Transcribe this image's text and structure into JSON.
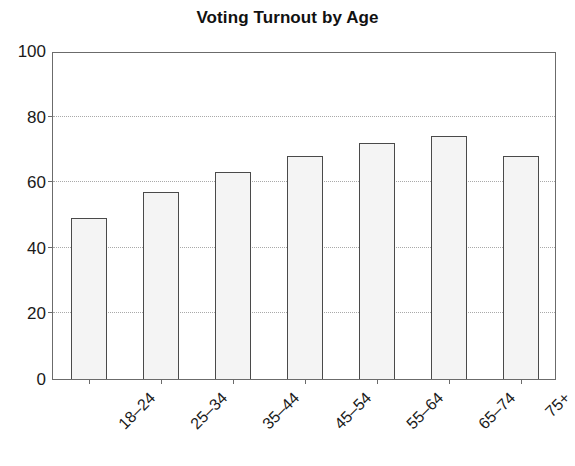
{
  "chart_data": {
    "type": "bar",
    "title": "Voting Turnout by Age",
    "xlabel": "",
    "ylabel": "",
    "categories": [
      "18–24",
      "25–34",
      "35–44",
      "45–54",
      "55–64",
      "65–74",
      "75+"
    ],
    "values": [
      49,
      57,
      63,
      68,
      72,
      74,
      68
    ],
    "ylim": [
      0,
      100
    ],
    "yticks": [
      0,
      20,
      40,
      60,
      80,
      100
    ],
    "ytick_labels": [
      "0",
      "20",
      "40",
      "60",
      "80",
      "100"
    ],
    "grid": "horizontal-dotted",
    "legend": null,
    "colors": {
      "bar_fill": "#f4f4f4",
      "bar_edge": "#4a4a4a",
      "axis": "#6b6b6b",
      "grid": "#a9a9a9",
      "text": "#1a1a1a",
      "background": "#ffffff"
    }
  }
}
